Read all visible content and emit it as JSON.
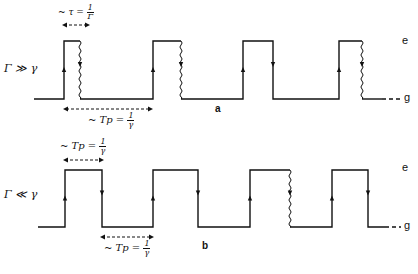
{
  "panels": [
    {
      "id": "a",
      "panel_label": "a",
      "condition_label": "Γ ≫ γ",
      "level_upper": "e",
      "level_lower": "g",
      "top_annotation": {
        "prefix": "~ τ =",
        "num": "1",
        "den": "Γ"
      },
      "bottom_annotation": {
        "prefix": "~ Tp =",
        "num": "1",
        "den": "γ"
      },
      "pulses": [
        {
          "rise_x": 64,
          "fall_x": 80,
          "fall_type": "wavy"
        },
        {
          "rise_x": 153,
          "fall_x": 181,
          "fall_type": "wavy"
        },
        {
          "rise_x": 243,
          "fall_x": 273,
          "fall_type": "straight"
        },
        {
          "rise_x": 339,
          "fall_x": 362,
          "fall_type": "wavy"
        }
      ]
    },
    {
      "id": "b",
      "panel_label": "b",
      "condition_label": "Γ ≪ γ",
      "level_upper": "e",
      "level_lower": "g",
      "top_annotation": {
        "prefix": "~ Tp =",
        "num": "1",
        "den": "γ"
      },
      "bottom_annotation": {
        "prefix": "~ Tp =",
        "num": "1",
        "den": "γ"
      },
      "pulses": [
        {
          "rise_x": 65,
          "fall_x": 102,
          "fall_type": "straight"
        },
        {
          "rise_x": 153,
          "fall_x": 198,
          "fall_type": "straight"
        },
        {
          "rise_x": 250,
          "fall_x": 290,
          "fall_type": "wavy"
        },
        {
          "rise_x": 332,
          "fall_x": 368,
          "fall_type": "straight"
        }
      ]
    }
  ]
}
